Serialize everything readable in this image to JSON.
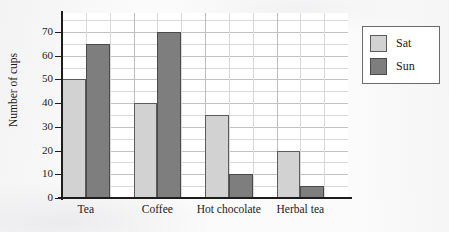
{
  "chart_data": {
    "type": "bar",
    "title": "",
    "xlabel": "",
    "ylabel": "Number of cups",
    "categories": [
      "Tea",
      "Coffee",
      "Hot chocolate",
      "Herbal tea"
    ],
    "series": [
      {
        "name": "Sat",
        "color": "#d2d2d2",
        "values": [
          50,
          40,
          35,
          20
        ]
      },
      {
        "name": "Sun",
        "color": "#7e7e7e",
        "values": [
          65,
          70,
          10,
          5
        ]
      }
    ],
    "ylim": [
      0,
      78
    ],
    "ytick_labels": [
      "0",
      "10",
      "20",
      "30",
      "40",
      "50",
      "60",
      "70"
    ],
    "ytick_values": [
      0,
      10,
      20,
      30,
      40,
      50,
      60,
      70
    ],
    "minor_tick_step": 5,
    "grid": true,
    "legend_position": "right"
  },
  "legend": {
    "entries": [
      {
        "label": "Sat",
        "color": "#d2d2d2"
      },
      {
        "label": "Sun",
        "color": "#7e7e7e"
      }
    ]
  }
}
